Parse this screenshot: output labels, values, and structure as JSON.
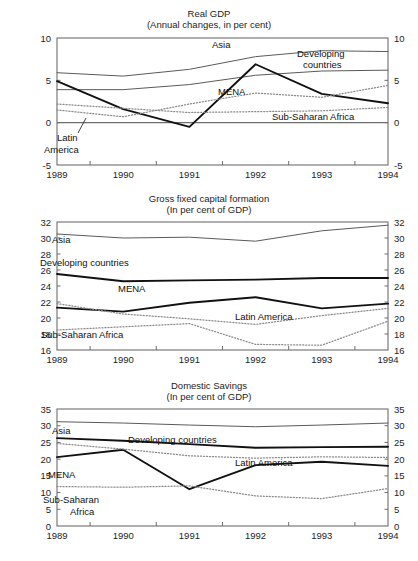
{
  "figure": {
    "years": [
      "1989",
      "1990",
      "1991",
      "1992",
      "1993",
      "1994"
    ],
    "series_names": {
      "asia": "Asia",
      "developing": "Developing countries",
      "developing_line1": "Developing",
      "developing_line2": "countries",
      "mena": "MENA",
      "latin": "Latin America",
      "latin_line1": "Latin",
      "latin_line2": "America",
      "ssa": "Sub-Saharan Africa",
      "ssa_line1": "Sub-Saharan",
      "ssa_line2": "Africa"
    },
    "colors": {
      "axis": "#6e6e6e",
      "thin_line": "#5a5a5a",
      "bold_line": "#111111",
      "dotted_line": "#8a8a8a",
      "text": "#1d1d1d"
    }
  },
  "chart_data": [
    {
      "type": "line",
      "title": "Real GDP",
      "subtitle": "(Annual changes, in per cent)",
      "xlabel": "",
      "ylabel": "",
      "x": [
        "1989",
        "1990",
        "1991",
        "1992",
        "1993",
        "1994"
      ],
      "ylim": [
        -5,
        10
      ],
      "yticks": [
        -5,
        0,
        5,
        10
      ],
      "ytick_labels": [
        "-5",
        "0",
        "5",
        "10"
      ],
      "grid": false,
      "legend": "inline-annotations",
      "zero_line": true,
      "series": [
        {
          "name": "Asia",
          "style": "thin-solid",
          "values": [
            5.9,
            5.5,
            6.3,
            7.8,
            8.5,
            8.4
          ]
        },
        {
          "name": "Developing countries",
          "style": "thin-solid",
          "values": [
            3.9,
            3.9,
            4.5,
            5.6,
            6.1,
            6.2
          ]
        },
        {
          "name": "MENA",
          "style": "bold-solid",
          "values": [
            4.9,
            1.6,
            -0.5,
            6.9,
            3.4,
            2.3
          ]
        },
        {
          "name": "Latin America",
          "style": "dotted",
          "values": [
            1.5,
            0.7,
            2.2,
            3.5,
            3.0,
            4.4
          ]
        },
        {
          "name": "Sub-Saharan Africa",
          "style": "dotted",
          "values": [
            2.2,
            1.7,
            1.2,
            1.3,
            1.4,
            1.8
          ]
        }
      ]
    },
    {
      "type": "line",
      "title": "Gross fixed capital formation",
      "subtitle": "(In per cent of GDP)",
      "xlabel": "",
      "ylabel": "",
      "x": [
        "1989",
        "1990",
        "1991",
        "1992",
        "1993",
        "1994"
      ],
      "ylim": [
        16,
        32
      ],
      "yticks": [
        16,
        18,
        20,
        22,
        24,
        26,
        28,
        30,
        32
      ],
      "ytick_labels": [
        "16",
        "18",
        "20",
        "22",
        "24",
        "26",
        "28",
        "30",
        "32"
      ],
      "grid": false,
      "legend": "inline-annotations",
      "zero_line": false,
      "series": [
        {
          "name": "Asia",
          "style": "thin-solid",
          "values": [
            30.5,
            30.0,
            30.1,
            29.6,
            30.9,
            31.6
          ]
        },
        {
          "name": "Developing countries",
          "style": "bold-solid",
          "values": [
            25.5,
            24.6,
            24.7,
            24.8,
            25.0,
            25.0
          ]
        },
        {
          "name": "MENA",
          "style": "bold-solid",
          "values": [
            21.3,
            20.8,
            21.9,
            22.6,
            21.2,
            21.8
          ]
        },
        {
          "name": "Latin America",
          "style": "dotted",
          "values": [
            21.8,
            20.5,
            19.9,
            19.2,
            20.3,
            21.2
          ]
        },
        {
          "name": "Sub-Saharan Africa",
          "style": "dotted",
          "values": [
            18.5,
            18.9,
            19.3,
            16.7,
            16.6,
            19.6
          ]
        }
      ]
    },
    {
      "type": "line",
      "title": "Domestic Savings",
      "subtitle": "(In per cent of GDP)",
      "xlabel": "",
      "ylabel": "",
      "x": [
        "1989",
        "1990",
        "1991",
        "1992",
        "1993",
        "1994"
      ],
      "ylim": [
        0,
        35
      ],
      "yticks": [
        0,
        5,
        10,
        15,
        20,
        25,
        30,
        35
      ],
      "ytick_labels": [
        "0",
        "5",
        "10",
        "15",
        "20",
        "25",
        "30",
        "35"
      ],
      "grid": false,
      "legend": "inline-annotations",
      "zero_line": false,
      "series": [
        {
          "name": "Asia",
          "style": "thin-solid",
          "values": [
            31.2,
            30.8,
            30.2,
            29.7,
            30.2,
            30.8
          ]
        },
        {
          "name": "Developing countries",
          "style": "bold-solid",
          "values": [
            26.3,
            25.5,
            24.5,
            23.4,
            23.6,
            23.7
          ]
        },
        {
          "name": "MENA",
          "style": "bold-solid",
          "values": [
            20.6,
            22.8,
            11.0,
            18.2,
            19.2,
            18.0
          ]
        },
        {
          "name": "Latin America",
          "style": "dotted",
          "values": [
            24.7,
            23.0,
            21.0,
            20.3,
            20.7,
            20.5
          ]
        },
        {
          "name": "Sub-Saharan Africa",
          "style": "dotted",
          "values": [
            11.8,
            11.6,
            12.0,
            9.0,
            8.2,
            11.2
          ]
        }
      ]
    }
  ],
  "annotations": {
    "panel1": [
      {
        "id": "asia",
        "text": "Asia",
        "x": 212,
        "y": 48
      },
      {
        "id": "developing-l1",
        "text": "Developing",
        "x": 297,
        "y": 57
      },
      {
        "id": "developing-l2",
        "text": "countries",
        "x": 303,
        "y": 68
      },
      {
        "id": "mena",
        "text": "MENA",
        "x": 218,
        "y": 95
      },
      {
        "id": "latin-l1",
        "text": "Latin",
        "x": 57,
        "y": 141
      },
      {
        "id": "latin-l2",
        "text": "America",
        "x": 44,
        "y": 153
      },
      {
        "id": "ssa",
        "text": "Sub-Saharan Africa",
        "x": 272,
        "y": 120
      }
    ],
    "panel2": [
      {
        "id": "asia",
        "text": "Asia",
        "x": 52,
        "y": 243
      },
      {
        "id": "developing",
        "text": "Developing countries",
        "x": 40,
        "y": 266
      },
      {
        "id": "mena",
        "text": "MENA",
        "x": 118,
        "y": 292
      },
      {
        "id": "latin",
        "text": "Latin America",
        "x": 235,
        "y": 320
      },
      {
        "id": "ssa",
        "text": "Sub-Saharan Africa",
        "x": 41,
        "y": 338
      }
    ],
    "panel3": [
      {
        "id": "asia",
        "text": "Asia",
        "x": 52,
        "y": 434
      },
      {
        "id": "developing",
        "text": "Developing countries",
        "x": 128,
        "y": 443
      },
      {
        "id": "mena",
        "text": "MENA",
        "x": 48,
        "y": 478
      },
      {
        "id": "latin",
        "text": "Latin America",
        "x": 235,
        "y": 466
      },
      {
        "id": "ssa-l1",
        "text": "Sub-Saharan",
        "x": 43,
        "y": 503
      },
      {
        "id": "ssa-l2",
        "text": "Africa",
        "x": 70,
        "y": 515
      }
    ]
  }
}
